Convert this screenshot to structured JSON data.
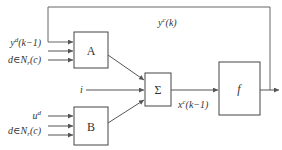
{
  "diagram": {
    "colors": {
      "line": "#555555",
      "text": "#333333",
      "background": "#ffffff"
    },
    "blocks": {
      "A": {
        "label": "A"
      },
      "B": {
        "label": "B"
      },
      "sum": {
        "label": "Σ"
      },
      "f": {
        "label": "f"
      }
    },
    "inputs_A": {
      "label_1_main": "y",
      "label_1_sup": "d",
      "label_1_rest": "(k−1)",
      "label_2_main": "d∈N",
      "label_2_sub": "r",
      "label_2_rest": "(c)"
    },
    "inputs_B": {
      "label_1_main": "u",
      "label_1_sup": "d",
      "label_2_main": "d∈N",
      "label_2_sub": "r",
      "label_2_rest": "(c)"
    },
    "input_i": {
      "label": "i"
    },
    "feedback": {
      "label_main": "y",
      "label_sup": "c",
      "label_rest": "(k)"
    },
    "sum_output": {
      "label_main": "x",
      "label_sup": "c",
      "label_rest": "(k−1)"
    }
  }
}
